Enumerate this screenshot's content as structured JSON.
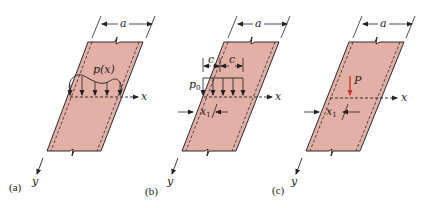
{
  "figure": {
    "colors": {
      "plate_fill": "#e3b0a5",
      "plate_edge": "#2a2a2a",
      "point_load": "#c8312a",
      "line": "#222222"
    },
    "panels": [
      {
        "id": "a",
        "caption": "(a)",
        "width_label": "a",
        "axis_x_label": "x",
        "axis_y_label": "y",
        "load_label": "p(x)",
        "load_type": "distributed-varying"
      },
      {
        "id": "b",
        "caption": "(b)",
        "width_label": "a",
        "axis_x_label": "x",
        "axis_y_label": "y",
        "load_label": "p",
        "load_sub": "0",
        "offset_label": "x",
        "offset_sub": "1",
        "half_width_label_left": "c",
        "half_width_label_right": "c",
        "load_type": "uniform-patch"
      },
      {
        "id": "c",
        "caption": "(c)",
        "width_label": "a",
        "axis_x_label": "x",
        "axis_y_label": "y",
        "load_label": "P",
        "offset_label": "x",
        "offset_sub": "1",
        "load_type": "point"
      }
    ]
  }
}
